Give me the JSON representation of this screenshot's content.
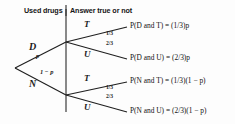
{
  "figure": {
    "type": "probability-tree-diagram",
    "headers": {
      "left": "Used drugs",
      "right": "Answer true or not"
    },
    "root": {
      "name": "root"
    },
    "stage1": [
      {
        "node": "D",
        "prob_label": "p"
      },
      {
        "node": "N",
        "prob_label": "1 − p"
      }
    ],
    "stage2_labels": [
      {
        "node": "T",
        "frac": "1/3"
      },
      {
        "node": "U",
        "frac": "2/3"
      },
      {
        "node": "T",
        "frac": "1/3"
      },
      {
        "node": "U",
        "frac": "2/3"
      }
    ],
    "outcomes": [
      {
        "event": "P(D and T)",
        "equals": "=",
        "value": "(1/3)p"
      },
      {
        "event": "P(D and U)",
        "equals": "=",
        "value": "(2/3)p"
      },
      {
        "event": "P(N and T)",
        "equals": "=",
        "value": "(1/3)(1 − p)"
      },
      {
        "event": "P(N and U)",
        "equals": "=",
        "value": "(2/3)(1 − p)"
      }
    ],
    "colors": {
      "ink": "#1a1a1a",
      "line": "#2a2a2a",
      "background": "#fdfdfd"
    }
  }
}
